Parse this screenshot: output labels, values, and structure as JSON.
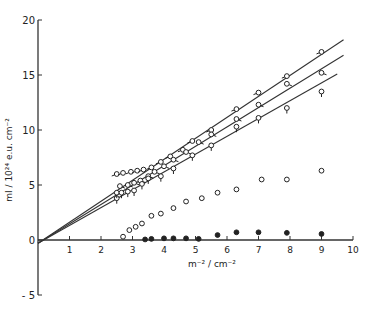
{
  "chart_data": {
    "type": "scatter",
    "title": "",
    "xlabel": "m⁻² / cm⁻²",
    "ylabel": "mI / 10²⁴ e.u. cm⁻²",
    "xlim": [
      0,
      10
    ],
    "ylim": [
      -5,
      20
    ],
    "x_ticks": [
      1,
      2,
      3,
      4,
      5,
      6,
      7,
      8,
      9,
      10
    ],
    "y_ticks": [
      -5,
      0,
      5,
      10,
      15,
      20
    ],
    "grid": false,
    "legend": "none",
    "fit_lines": [
      {
        "name": "line-top",
        "from": [
          0,
          -0.3
        ],
        "to": [
          9.7,
          18.2
        ]
      },
      {
        "name": "line-middle",
        "from": [
          0,
          -0.3
        ],
        "to": [
          9.7,
          16.8
        ]
      },
      {
        "name": "line-bottom",
        "from": [
          0,
          -0.3
        ],
        "to": [
          9.5,
          15.1
        ]
      }
    ],
    "series": [
      {
        "name": "series-A (open circle, tail left)",
        "marker": "circle-tail-left",
        "points": [
          [
            2.5,
            6.0
          ],
          [
            2.7,
            6.1
          ],
          [
            2.95,
            6.2
          ],
          [
            3.15,
            6.3
          ],
          [
            3.35,
            6.4
          ],
          [
            3.6,
            6.6
          ],
          [
            3.9,
            7.1
          ],
          [
            4.2,
            7.6
          ],
          [
            4.6,
            8.2
          ],
          [
            4.9,
            9.0
          ],
          [
            5.5,
            10.0
          ],
          [
            6.3,
            11.9
          ],
          [
            7.0,
            13.4
          ],
          [
            7.9,
            14.9
          ],
          [
            9.0,
            17.1
          ]
        ]
      },
      {
        "name": "series-B (open circle, tail right)",
        "marker": "circle-tail-right",
        "points": [
          [
            2.6,
            4.9
          ],
          [
            2.85,
            5.0
          ],
          [
            3.05,
            5.2
          ],
          [
            3.25,
            5.4
          ],
          [
            3.5,
            5.8
          ],
          [
            3.7,
            6.2
          ],
          [
            4.0,
            6.7
          ],
          [
            4.3,
            7.3
          ],
          [
            4.7,
            8.0
          ],
          [
            5.1,
            8.9
          ],
          [
            5.5,
            9.6
          ],
          [
            6.3,
            11.0
          ],
          [
            7.0,
            12.3
          ],
          [
            7.9,
            14.2
          ],
          [
            9.0,
            15.2
          ]
        ]
      },
      {
        "name": "series-C (open circle, tail down)",
        "marker": "circle-tail-down",
        "points": [
          [
            2.5,
            3.8
          ],
          [
            2.5,
            4.3
          ],
          [
            2.65,
            4.3
          ],
          [
            2.85,
            4.4
          ],
          [
            3.05,
            4.5
          ],
          [
            3.3,
            5.1
          ],
          [
            3.5,
            5.6
          ],
          [
            3.9,
            5.8
          ],
          [
            4.3,
            6.5
          ],
          [
            4.9,
            7.7
          ],
          [
            5.5,
            8.6
          ],
          [
            6.3,
            10.3
          ],
          [
            7.0,
            11.1
          ],
          [
            7.9,
            12.0
          ],
          [
            9.0,
            13.5
          ]
        ]
      },
      {
        "name": "series-D (open circle)",
        "marker": "circle-open",
        "points": [
          [
            2.7,
            0.3
          ],
          [
            2.9,
            0.9
          ],
          [
            3.1,
            1.2
          ],
          [
            3.3,
            1.5
          ],
          [
            3.6,
            2.2
          ],
          [
            3.9,
            2.4
          ],
          [
            4.3,
            2.9
          ],
          [
            4.7,
            3.5
          ],
          [
            5.2,
            3.8
          ],
          [
            5.7,
            4.3
          ],
          [
            6.3,
            4.6
          ],
          [
            7.1,
            5.5
          ],
          [
            7.9,
            5.5
          ],
          [
            9.0,
            6.3
          ]
        ]
      },
      {
        "name": "series-E (filled circle)",
        "marker": "circle-filled",
        "points": [
          [
            3.4,
            0.05
          ],
          [
            3.6,
            0.1
          ],
          [
            4.0,
            0.15
          ],
          [
            4.3,
            0.15
          ],
          [
            4.7,
            0.15
          ],
          [
            5.1,
            0.1
          ],
          [
            5.7,
            0.45
          ],
          [
            6.3,
            0.7
          ],
          [
            7.0,
            0.7
          ],
          [
            7.9,
            0.65
          ],
          [
            9.0,
            0.55
          ]
        ]
      }
    ]
  }
}
